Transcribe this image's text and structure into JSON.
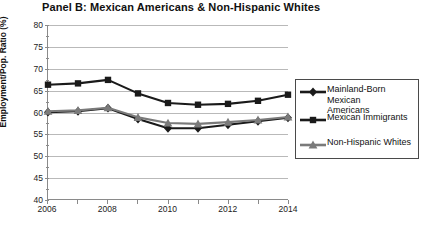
{
  "chart_data": {
    "type": "line",
    "title": "Panel B: Mexican Americans & Non-Hispanic Whites",
    "xlabel": "",
    "ylabel": "Employment/Pop. Ratio (%)",
    "x": [
      2006,
      2007,
      2008,
      2009,
      2010,
      2011,
      2012,
      2013,
      2014
    ],
    "xlim": [
      2006,
      2014
    ],
    "ylim": [
      40,
      80
    ],
    "yticks": [
      40,
      45,
      50,
      55,
      60,
      65,
      70,
      75,
      80
    ],
    "xticks": [
      2006,
      2008,
      2010,
      2012,
      2014
    ],
    "xtick_labels": [
      "2006",
      "2008",
      "2010",
      "2012",
      "2014"
    ],
    "grid": "horizontal",
    "legend_position": "right",
    "series": [
      {
        "name": "Mainland-Born Mexican Americans",
        "marker": "diamond",
        "color": "#1a1a1a",
        "values": [
          60.0,
          60.2,
          60.9,
          58.4,
          56.3,
          56.3,
          57.1,
          57.9,
          58.7
        ]
      },
      {
        "name": "Mexican Immigrants",
        "marker": "square",
        "color": "#1a1a1a",
        "values": [
          66.3,
          66.6,
          67.4,
          64.3,
          62.1,
          61.7,
          61.9,
          62.6,
          64.0
        ]
      },
      {
        "name": "Non-Hispanic Whites",
        "marker": "triangle",
        "color": "#7a7a7a",
        "values": [
          60.2,
          60.4,
          61.0,
          58.8,
          57.5,
          57.3,
          57.7,
          58.2,
          58.9
        ]
      }
    ]
  },
  "legend": {
    "items": [
      {
        "label": "Mainland-Born Mexican\nAmericans",
        "marker": "diamond",
        "color": "#1a1a1a"
      },
      {
        "label": "Mexican Immigrants",
        "marker": "square",
        "color": "#1a1a1a"
      },
      {
        "label": "Non-Hispanic Whites",
        "marker": "triangle",
        "color": "#7a7a7a"
      }
    ]
  }
}
